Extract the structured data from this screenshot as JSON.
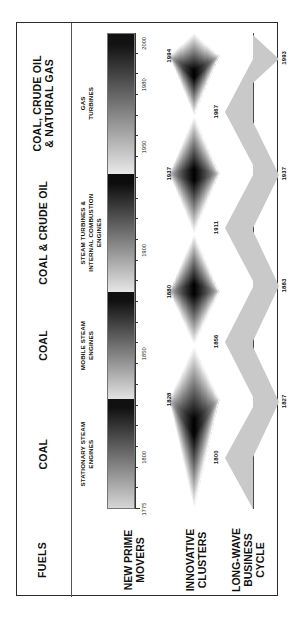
{
  "figure": {
    "orientation": "rotated-90-ccw",
    "border_color": "#2b2b2b",
    "background": "#ffffff"
  },
  "rows": {
    "fuels": {
      "label": "FUELS"
    },
    "prime_movers": {
      "label": "NEW PRIME\nMOVERS"
    },
    "innovative_clusters": {
      "label": "INNOVATIVE\nCLUSTERS"
    },
    "long_wave": {
      "label": "LONG-WAVE\nBUSINESS\nCYCLE"
    }
  },
  "fuel_eras": [
    {
      "label": "COAL"
    },
    {
      "label": "COAL"
    },
    {
      "label": "COAL & CRUDE OIL"
    },
    {
      "label": "COAL, CRUDE OIL\n& NATURAL GAS"
    }
  ],
  "prime_mover_eras": [
    {
      "label": "STATIONARY STEAM\nENGINES"
    },
    {
      "label": "MOBILE STEAM\nENGINES"
    },
    {
      "label": "STEAM TURBINES &\nINTERNAL COMBUSTION\nENGINES"
    },
    {
      "label": "GAS\nTURBINES"
    }
  ],
  "axis": {
    "start": 1775,
    "end": 2005,
    "tick_labels": [
      "1775",
      "1800",
      "1850",
      "1900",
      "1950",
      "1980",
      "2000"
    ],
    "tick_values": [
      1775,
      1800,
      1850,
      1900,
      1950,
      1980,
      2000
    ],
    "minor_step": 10
  },
  "chart_data": {
    "type": "area",
    "title": "",
    "xlabel": "",
    "ylabel": "",
    "xlim": [
      1775,
      2005
    ],
    "grid": false,
    "legend": "none",
    "series": [
      {
        "name": "New prime movers (diffusion gradient bands)",
        "type": "gradient-bands",
        "bands": [
          {
            "era": "STATIONARY STEAM ENGINES",
            "start": 1775,
            "end": 1828,
            "fuel": "COAL",
            "from_color": "#d8d8d8",
            "to_color": "#111111"
          },
          {
            "era": "MOBILE STEAM ENGINES",
            "start": 1828,
            "end": 1880,
            "fuel": "COAL",
            "from_color": "#e2e2e2",
            "to_color": "#101010"
          },
          {
            "era": "STEAM TURBINES & INTERNAL COMBUSTION ENGINES",
            "start": 1880,
            "end": 1937,
            "fuel": "COAL & CRUDE OIL",
            "from_color": "#e6e6e6",
            "to_color": "#0d0d0d"
          },
          {
            "era": "GAS TURBINES",
            "start": 1937,
            "end": 2005,
            "fuel": "COAL, CRUDE OIL & NATURAL GAS",
            "from_color": "#e9e9e9",
            "to_color": "#121212"
          }
        ]
      },
      {
        "name": "Innovative clusters (peak years)",
        "type": "lens",
        "peaks": [
          1828,
          1880,
          1937,
          1994
        ],
        "labels": [
          "1828",
          "1880",
          "1937",
          "1994"
        ],
        "minima": [
          1775,
          1854,
          1908,
          1965,
          2005
        ]
      },
      {
        "name": "Long-wave business cycle — upswing peaks",
        "type": "triangle-up",
        "peaks": [
          1800,
          1856,
          1911,
          1967
        ],
        "labels": [
          "1800",
          "1856",
          "1911",
          "1967"
        ]
      },
      {
        "name": "Long-wave business cycle — downswing troughs",
        "type": "triangle-down",
        "troughs": [
          1827,
          1883,
          1937,
          1993
        ],
        "labels": [
          "1827",
          "1883",
          "1937",
          "1993"
        ]
      }
    ]
  }
}
